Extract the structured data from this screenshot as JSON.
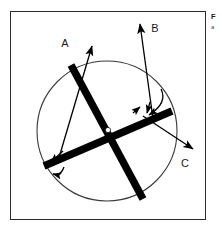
{
  "figure": {
    "name": "crossing-bars-in-circle-diagram",
    "background_color": "#ffffff",
    "frame_color": "#2b2b2b",
    "stroke_color": "#000000",
    "circle_stroke_color": "#3a3a3a",
    "labels": {
      "a": "A",
      "b": "B",
      "c": "C"
    },
    "geometry": {
      "circle_center_x": 106,
      "circle_center_y": 130,
      "circle_radius": 70,
      "crossing_point_x": 107,
      "crossing_point_y": 129,
      "bar_thickness": 7
    }
  },
  "caption": {
    "title": "F",
    "subtitle": "a"
  }
}
